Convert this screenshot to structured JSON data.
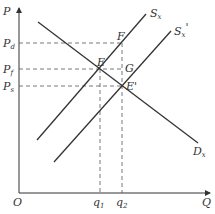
{
  "diagram": {
    "type": "supply-demand",
    "axes": {
      "y_label": "P",
      "x_label": "Q",
      "origin_label": "O"
    },
    "price_labels": [
      {
        "main": "P",
        "sub": "d"
      },
      {
        "main": "P",
        "sub": "f"
      },
      {
        "main": "P",
        "sub": "s"
      }
    ],
    "quantity_labels": [
      {
        "main": "q",
        "sub": "1"
      },
      {
        "main": "q",
        "sub": "2"
      }
    ],
    "curves": [
      {
        "main": "S",
        "sub": "x",
        "prime": ""
      },
      {
        "main": "S",
        "sub": "x",
        "prime": "'"
      },
      {
        "main": "D",
        "sub": "x",
        "prime": ""
      }
    ],
    "points": [
      "E",
      "F",
      "G",
      "E'"
    ],
    "colors": {
      "line": "#333333",
      "dash": "#555555",
      "bg": "#ffffff"
    }
  }
}
